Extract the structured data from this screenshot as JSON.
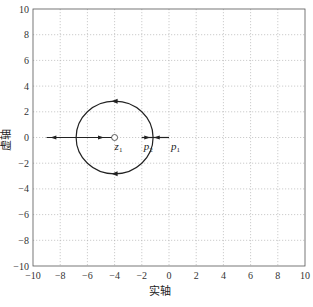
{
  "chart_data": {
    "type": "line",
    "title": "",
    "xlabel": "实轴",
    "ylabel": "虚轴",
    "xlim": [
      -10,
      10
    ],
    "ylim": [
      -10,
      10
    ],
    "xticks": [
      "-10",
      "-8",
      "-6",
      "-4",
      "-2",
      "0",
      "2",
      "4",
      "6",
      "8",
      "10"
    ],
    "yticks": [
      "10",
      "8",
      "6",
      "4",
      "2",
      "0",
      "-2",
      "-4",
      "-6",
      "-8",
      "-10"
    ],
    "grid": true,
    "annotations": [
      {
        "text": "z",
        "sub": "1",
        "x": -4,
        "y": 0,
        "kind": "zero"
      },
      {
        "text": "p",
        "sub": "2",
        "x": -2,
        "y": 0,
        "kind": "pole"
      },
      {
        "text": "p",
        "sub": "1",
        "x": 0,
        "y": 0,
        "kind": "pole"
      }
    ],
    "series": [
      {
        "name": "root-locus-circle",
        "center": [
          -4,
          0
        ],
        "radius": 2.83
      },
      {
        "name": "real-axis-left",
        "x": [
          -9,
          -4
        ],
        "y": [
          0,
          0
        ]
      },
      {
        "name": "real-axis-segment",
        "x": [
          -2,
          0
        ],
        "y": [
          0,
          0
        ]
      }
    ]
  }
}
